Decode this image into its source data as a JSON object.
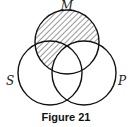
{
  "diagram": {
    "type": "venn-3",
    "sets": [
      {
        "label": "M",
        "cx": 67,
        "cy": 42,
        "r": 32
      },
      {
        "label": "S",
        "cx": 50,
        "cy": 73,
        "r": 32
      },
      {
        "label": "P",
        "cx": 84,
        "cy": 73,
        "r": 32
      }
    ],
    "shaded_region": "M minus P",
    "shading": "diagonal hatch",
    "stroke_color": "#111111"
  },
  "labels": {
    "m": "M",
    "s": "S",
    "p": "P"
  },
  "caption": "Figure 21"
}
